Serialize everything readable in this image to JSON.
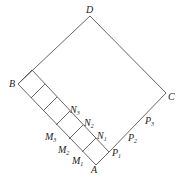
{
  "figure": {
    "points": {
      "D": {
        "label": "D",
        "x": 90,
        "y": 16
      },
      "B": {
        "label": "B",
        "x": 18,
        "y": 84
      },
      "A": {
        "label": "A",
        "x": 96,
        "y": 165
      },
      "C": {
        "label": "C",
        "x": 166,
        "y": 93
      }
    },
    "labels": [
      {
        "id": "D",
        "text": "D",
        "sub": "",
        "x": 86,
        "y": 13
      },
      {
        "id": "B",
        "text": "B",
        "sub": "",
        "x": 9,
        "y": 87
      },
      {
        "id": "C",
        "text": "C",
        "sub": "",
        "x": 168,
        "y": 100
      },
      {
        "id": "A",
        "text": "A",
        "sub": "",
        "x": 91,
        "y": 173
      },
      {
        "id": "N3",
        "text": "N",
        "sub": "3",
        "x": 70,
        "y": 113
      },
      {
        "id": "N2",
        "text": "N",
        "sub": "2",
        "x": 84,
        "y": 126
      },
      {
        "id": "N1",
        "text": "N",
        "sub": "1",
        "x": 97,
        "y": 139
      },
      {
        "id": "M3",
        "text": "M",
        "sub": "3",
        "x": 45,
        "y": 140
      },
      {
        "id": "M2",
        "text": "M",
        "sub": "2",
        "x": 58,
        "y": 153
      },
      {
        "id": "M1",
        "text": "M",
        "sub": "1",
        "x": 72,
        "y": 164
      },
      {
        "id": "P1",
        "text": "P",
        "sub": "1",
        "x": 112,
        "y": 156
      },
      {
        "id": "P2",
        "text": "P",
        "sub": "2",
        "x": 128,
        "y": 141
      },
      {
        "id": "P3",
        "text": "P",
        "sub": "3",
        "x": 145,
        "y": 124
      }
    ]
  }
}
